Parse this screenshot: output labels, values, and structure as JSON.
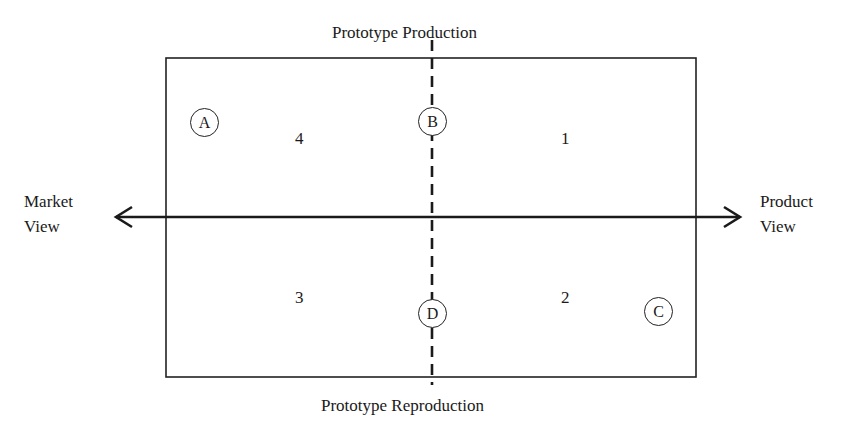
{
  "diagram": {
    "top_label": "Prototype Production",
    "bottom_label": "Prototype Reproduction",
    "left_label_line1": "Market",
    "left_label_line2": "View",
    "right_label_line1": "Product",
    "right_label_line2": "View",
    "quadrants": {
      "top_right": "1",
      "bottom_right": "2",
      "bottom_left": "3",
      "top_left": "4"
    },
    "markers": {
      "a": "A",
      "b": "B",
      "c": "C",
      "d": "D"
    },
    "colors": {
      "line": "#222222",
      "text": "#1a1a1a",
      "background": "#ffffff"
    }
  }
}
